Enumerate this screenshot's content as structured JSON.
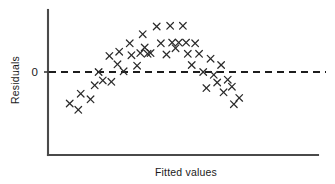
{
  "chart_data": {
    "type": "scatter",
    "title": "",
    "xlabel": "Fitted values",
    "ylabel": "Residuals",
    "ytick_labels": [
      "0"
    ],
    "ytick_values": [
      0
    ],
    "xtick_labels": [],
    "grid": false,
    "legend": null,
    "marker": "x",
    "marker_color": "#2b2b2b",
    "reference_line": {
      "orientation": "horizontal",
      "value": 0,
      "style": "dashed",
      "color": "#1d1d1d"
    },
    "axis_ranges": {
      "xlim": [
        0,
        10
      ],
      "ylim": [
        -3.2,
        4.2
      ]
    },
    "points": [
      {
        "x": 0.6,
        "y": -2.25
      },
      {
        "x": 0.95,
        "y": -2.7
      },
      {
        "x": 1.05,
        "y": -1.55
      },
      {
        "x": 1.45,
        "y": -1.95
      },
      {
        "x": 1.62,
        "y": -0.95
      },
      {
        "x": 1.78,
        "y": 0.0
      },
      {
        "x": 1.95,
        "y": -0.6
      },
      {
        "x": 2.22,
        "y": 1.15
      },
      {
        "x": 2.3,
        "y": -0.7
      },
      {
        "x": 2.55,
        "y": 0.55
      },
      {
        "x": 2.62,
        "y": 1.45
      },
      {
        "x": 2.8,
        "y": 0.05
      },
      {
        "x": 3.05,
        "y": 2.05
      },
      {
        "x": 3.12,
        "y": 1.2
      },
      {
        "x": 3.35,
        "y": 0.45
      },
      {
        "x": 3.48,
        "y": 1.35
      },
      {
        "x": 3.58,
        "y": 2.7
      },
      {
        "x": 3.66,
        "y": 1.75
      },
      {
        "x": 3.78,
        "y": 1.3
      },
      {
        "x": 3.9,
        "y": 1.35
      },
      {
        "x": 4.15,
        "y": 3.25
      },
      {
        "x": 4.32,
        "y": 2.05
      },
      {
        "x": 4.55,
        "y": 1.25
      },
      {
        "x": 4.7,
        "y": 3.3
      },
      {
        "x": 4.78,
        "y": 2.1
      },
      {
        "x": 4.92,
        "y": 1.7
      },
      {
        "x": 5.05,
        "y": 2.1
      },
      {
        "x": 5.22,
        "y": 3.3
      },
      {
        "x": 5.35,
        "y": 2.1
      },
      {
        "x": 5.42,
        "y": 1.3
      },
      {
        "x": 5.58,
        "y": 0.5
      },
      {
        "x": 5.72,
        "y": 2.05
      },
      {
        "x": 5.88,
        "y": 1.3
      },
      {
        "x": 6.05,
        "y": 0.0
      },
      {
        "x": 6.18,
        "y": -1.15
      },
      {
        "x": 6.35,
        "y": 0.95
      },
      {
        "x": 6.48,
        "y": -0.2
      },
      {
        "x": 6.62,
        "y": -0.75
      },
      {
        "x": 6.78,
        "y": 0.5
      },
      {
        "x": 6.88,
        "y": -1.45
      },
      {
        "x": 7.05,
        "y": -0.55
      },
      {
        "x": 7.22,
        "y": -1.05
      },
      {
        "x": 7.3,
        "y": -2.3
      },
      {
        "x": 7.52,
        "y": -1.85
      }
    ]
  }
}
